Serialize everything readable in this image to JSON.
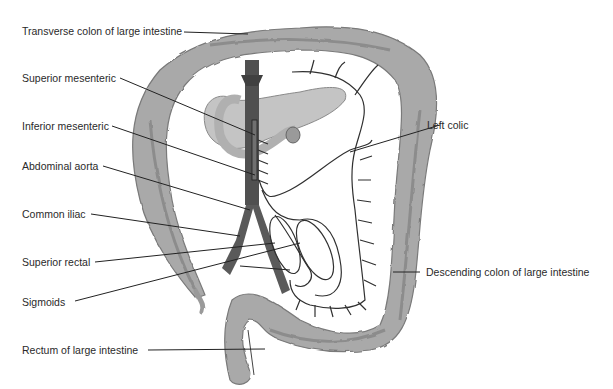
{
  "diagram": {
    "colors": {
      "colon_fill": "#a9a9a9",
      "colon_shade": "#8c8c8c",
      "aorta_fill": "#505050",
      "pancreas_fill": "#c4c4c4",
      "vessel_stroke": "#303030",
      "leader_line": "#222222",
      "label_text": "#2a2a2a"
    },
    "labels": {
      "transverse_colon": "Transverse colon of large intestine",
      "superior_mesenteric": "Superior mesenteric",
      "inferior_mesenteric": "Inferior mesenteric",
      "abdominal_aorta": "Abdominal aorta",
      "common_iliac": "Common iliac",
      "superior_rectal": "Superior rectal",
      "sigmoids": "Sigmoids",
      "rectum": "Rectum of large intestine",
      "left_colic": "Left colic",
      "descending_colon": "Descending colon of large intestine"
    }
  }
}
